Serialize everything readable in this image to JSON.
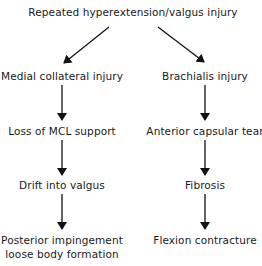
{
  "diagram": {
    "root": "Repeated hyperextension/valgus injury",
    "left_chain": [
      "Medial collateral injury",
      "Loss of MCL support",
      "Drift into valgus",
      "Posterior impingement",
      "loose body formation"
    ],
    "right_chain": [
      "Brachialis injury",
      "Anterior capsular tear",
      "Fibrosis",
      "Flexion contracture"
    ],
    "colors": {
      "text": "#1a1a1a",
      "arrow": "#111111",
      "background": "#ffffff"
    }
  }
}
